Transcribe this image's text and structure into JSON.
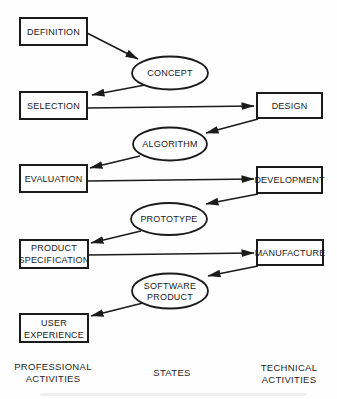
{
  "colors": {
    "ink": "#1b1b1b",
    "background": "#fefefe"
  },
  "professional_activities": {
    "definition": "DEFINITION",
    "selection": "SELECTION",
    "evaluation": "EVALUATION",
    "product_specification": {
      "line1": "PRODUCT",
      "line2": "SPECIFICATION"
    },
    "user_experience": {
      "line1": "USER",
      "line2": "EXPERIENCE"
    }
  },
  "states": {
    "concept": "CONCEPT",
    "algorithm": "ALGORITHM",
    "prototype": "PROTOTYPE",
    "software_product": {
      "line1": "SOFTWARE",
      "line2": "PRODUCT"
    }
  },
  "technical_activities": {
    "design": "DESIGN",
    "development": "DEVELOPMENT",
    "manufacture": "MANUFACTURE"
  },
  "footer": {
    "left": {
      "line1": "PROFESSIONAL",
      "line2": "ACTIVITIES"
    },
    "center": "STATES",
    "right": {
      "line1": "TECHNICAL",
      "line2": "ACTIVITIES"
    }
  },
  "connections": [
    {
      "from": "DEFINITION",
      "to": "CONCEPT"
    },
    {
      "from": "CONCEPT",
      "to": "SELECTION"
    },
    {
      "from": "SELECTION",
      "to": "DESIGN"
    },
    {
      "from": "DESIGN",
      "to": "ALGORITHM"
    },
    {
      "from": "ALGORITHM",
      "to": "EVALUATION"
    },
    {
      "from": "EVALUATION",
      "to": "DEVELOPMENT"
    },
    {
      "from": "DEVELOPMENT",
      "to": "PROTOTYPE"
    },
    {
      "from": "PROTOTYPE",
      "to": "PRODUCT SPECIFICATION"
    },
    {
      "from": "PRODUCT SPECIFICATION",
      "to": "MANUFACTURE"
    },
    {
      "from": "MANUFACTURE",
      "to": "SOFTWARE PRODUCT"
    },
    {
      "from": "SOFTWARE PRODUCT",
      "to": "USER EXPERIENCE"
    }
  ]
}
